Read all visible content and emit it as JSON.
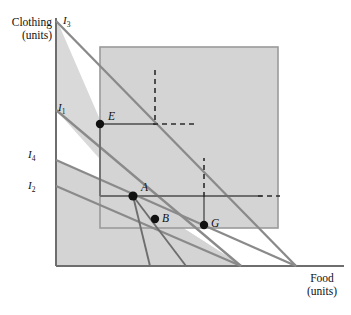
{
  "figure": {
    "width": 351,
    "height": 315,
    "background_color": "#ffffff"
  },
  "axes": {
    "y_axis": {
      "label_line1": "Clothing",
      "label_line2": "(units)",
      "x_px": 55,
      "top_px": 18,
      "bottom_px": 266
    },
    "x_axis": {
      "label_line1": "Food",
      "label_line2": "(units)",
      "y_px": 266,
      "left_px": 55,
      "right_px": 344
    },
    "axis_color": "#6e6e6e"
  },
  "shaded_region": {
    "name": "feasible-area",
    "color": "#d4d4d4",
    "border_color": "#9a9a9a",
    "x_px": 100,
    "y_px": 47,
    "width_px": 178,
    "height_px": 181
  },
  "background_region": {
    "name": "chart-backdrop",
    "color": "#d6d6d6",
    "x_px": 55,
    "y_px": 18,
    "width_px": 289,
    "height_px": 248
  },
  "curves": [
    {
      "id": "I3",
      "label": "I",
      "subscript": "3",
      "label_x_px": 63,
      "label_y_px": 15,
      "color": "#8a8a8a",
      "y_intercept_px": 21,
      "x_intercept_px": 296,
      "kind": "budget-line"
    },
    {
      "id": "I1",
      "label": "I",
      "subscript": "1",
      "label_x_px": 58,
      "label_y_px": 103,
      "color": "#8a8a8a",
      "y_intercept_px": 110,
      "x_intercept_px": 241,
      "kind": "budget-line"
    },
    {
      "id": "I4",
      "label": "I",
      "subscript": "4",
      "label_x_px": 28,
      "label_y_px": 148,
      "color": "#8a8a8a",
      "y_intercept_px": 160,
      "x_intercept_px": 296,
      "kind": "indifference-curve"
    },
    {
      "id": "I2",
      "label": "I",
      "subscript": "2",
      "label_x_px": 28,
      "label_y_px": 180,
      "color": "#8a8a8a",
      "y_intercept_px": 186,
      "x_intercept_px": 241,
      "kind": "indifference-curve"
    }
  ],
  "extra_rays": [
    {
      "name": "ray-from-A-steep",
      "from_x": 133,
      "from_y": 196,
      "to_x": 150,
      "to_y": 266
    },
    {
      "name": "ray-from-A-mid",
      "from_x": 133,
      "from_y": 196,
      "to_x": 186,
      "to_y": 266
    }
  ],
  "points": [
    {
      "id": "E",
      "label": "E",
      "x_px": 100,
      "y_px": 124,
      "label_dx": 8,
      "label_dy": -14
    },
    {
      "id": "A",
      "label": "A",
      "x_px": 133,
      "y_px": 196,
      "label_dx": 8,
      "label_dy": -15
    },
    {
      "id": "B",
      "label": "B",
      "x_px": 155,
      "y_px": 219,
      "label_dx": 7,
      "label_dy": -3
    },
    {
      "id": "G",
      "label": "G",
      "x_px": 204,
      "y_px": 225,
      "label_dx": 7,
      "label_dy": -4
    }
  ],
  "guide_lines": {
    "solid_color": "#6e6e6e",
    "dashed_color": "#2b2b2b",
    "segments": [
      {
        "name": "E-vertical-drop",
        "style": "solid",
        "x1": 100,
        "y1": 124,
        "x2": 100,
        "y2": 196
      },
      {
        "name": "E-horizontal-solid",
        "style": "solid",
        "x1": 100,
        "y1": 124,
        "x2": 155,
        "y2": 124
      },
      {
        "name": "E-horizontal-dashed",
        "style": "dashed",
        "x1": 155,
        "y1": 124,
        "x2": 193,
        "y2": 124
      },
      {
        "name": "E-upper-vertical-dashed",
        "style": "dashed",
        "x1": 155,
        "y1": 70,
        "x2": 155,
        "y2": 124
      },
      {
        "name": "A-horizontal-solid",
        "style": "solid",
        "x1": 100,
        "y1": 196,
        "x2": 262,
        "y2": 196
      },
      {
        "name": "A-horizontal-dashed",
        "style": "dashed",
        "x1": 262,
        "y1": 196,
        "x2": 278,
        "y2": 196
      },
      {
        "name": "G-vertical-solid",
        "style": "solid",
        "x1": 204,
        "y1": 225,
        "x2": 204,
        "y2": 196
      },
      {
        "name": "G-vertical-dashed",
        "style": "dashed",
        "x1": 204,
        "y1": 196,
        "x2": 204,
        "y2": 160
      }
    ]
  },
  "colors": {
    "line_gray": "#8a8a8a",
    "guide_gray": "#6e6e6e",
    "dash_dark": "#2b2b2b",
    "point_black": "#111111",
    "shade_gray": "#d4d4d4",
    "backdrop_gray": "#d6d6d6",
    "white": "#ffffff"
  }
}
